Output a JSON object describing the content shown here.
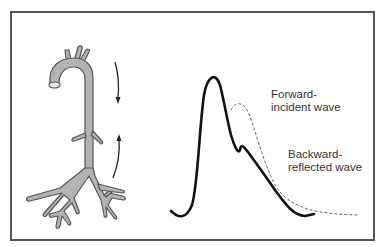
{
  "diagram": {
    "type": "arterial-pressure-wave-reflection",
    "labels": {
      "forward": [
        "Forward-",
        "incident wave"
      ],
      "backward": [
        "Backward-",
        "reflected wave"
      ]
    },
    "elements": {
      "artery": "aorta-with-branches",
      "arrow_down": "forward-travel-arrow",
      "arrow_up": "backward-travel-arrow",
      "solid_curve": "measured-pressure-wave",
      "dashed_curve": "forward-incident-wave"
    },
    "colors": {
      "artery_fill": "#b3b3b3",
      "artery_stroke": "#555555",
      "curve": "#111111",
      "dashed": "#666666",
      "border": "#555555"
    }
  }
}
